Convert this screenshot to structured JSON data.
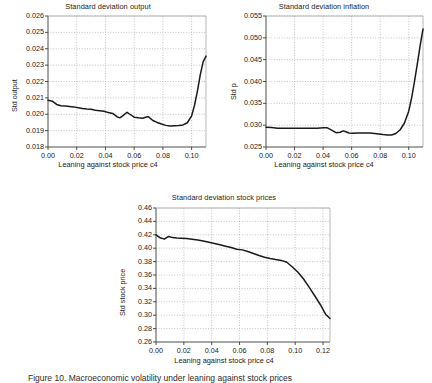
{
  "figure": {
    "caption_visible_fragment": "Figure 10. Macroeconomic volatility under leaning against stock prices"
  },
  "chart_data": [
    {
      "id": "std-output",
      "type": "line",
      "title": "Standard deviation output",
      "xlabel": "Leaning against stock price c4",
      "ylabel": "Std output",
      "xlim": [
        0.0,
        0.11
      ],
      "ylim": [
        0.018,
        0.026
      ],
      "xticks": [
        "0.00",
        "0.02",
        "0.04",
        "0.06",
        "0.08",
        "0.10"
      ],
      "xtick_values": [
        0.0,
        0.02,
        0.04,
        0.06,
        0.08,
        0.1
      ],
      "yticks": [
        "0.018",
        "0.019",
        "0.020",
        "0.021",
        "0.022",
        "0.023",
        "0.024",
        "0.025",
        "0.026"
      ],
      "ytick_values": [
        0.018,
        0.019,
        0.02,
        0.021,
        0.022,
        0.023,
        0.024,
        0.025,
        0.026
      ],
      "grid": true,
      "legend": "none",
      "line_color": "#1a1a1a",
      "x": [
        0.0,
        0.003,
        0.006,
        0.009,
        0.012,
        0.015,
        0.018,
        0.021,
        0.024,
        0.027,
        0.03,
        0.033,
        0.036,
        0.039,
        0.042,
        0.045,
        0.048,
        0.05,
        0.052,
        0.055,
        0.057,
        0.06,
        0.063,
        0.066,
        0.069,
        0.07,
        0.073,
        0.076,
        0.079,
        0.082,
        0.085,
        0.088,
        0.091,
        0.094,
        0.097,
        0.1,
        0.102,
        0.104,
        0.106,
        0.108,
        0.11
      ],
      "y": [
        0.02085,
        0.0208,
        0.0206,
        0.02052,
        0.0205,
        0.02048,
        0.02045,
        0.0204,
        0.02035,
        0.02032,
        0.0203,
        0.02025,
        0.02022,
        0.02018,
        0.0201,
        0.02005,
        0.01985,
        0.01978,
        0.0199,
        0.02012,
        0.02,
        0.01982,
        0.01978,
        0.01976,
        0.01985,
        0.01984,
        0.01962,
        0.0195,
        0.0194,
        0.01932,
        0.01928,
        0.0193,
        0.01932,
        0.01935,
        0.01948,
        0.0199,
        0.02055,
        0.0214,
        0.0224,
        0.0232,
        0.02355
      ]
    },
    {
      "id": "std-inflation",
      "type": "line",
      "title": "Standard deviation inflation",
      "xlabel": "Leaning against stock price c4",
      "ylabel": "Std p",
      "xlim": [
        0.0,
        0.11
      ],
      "ylim": [
        0.025,
        0.055
      ],
      "xticks": [
        "0.00",
        "0.02",
        "0.04",
        "0.06",
        "0.08",
        "0.10"
      ],
      "xtick_values": [
        0.0,
        0.02,
        0.04,
        0.06,
        0.08,
        0.1
      ],
      "yticks": [
        "0.025",
        "0.030",
        "0.035",
        "0.040",
        "0.045",
        "0.050",
        "0.055"
      ],
      "ytick_values": [
        0.025,
        0.03,
        0.035,
        0.04,
        0.045,
        0.05,
        0.055
      ],
      "grid": true,
      "legend": "none",
      "line_color": "#1a1a1a",
      "x": [
        0.0,
        0.004,
        0.008,
        0.012,
        0.016,
        0.02,
        0.024,
        0.028,
        0.032,
        0.036,
        0.04,
        0.043,
        0.046,
        0.049,
        0.052,
        0.054,
        0.056,
        0.058,
        0.061,
        0.064,
        0.067,
        0.07,
        0.073,
        0.076,
        0.079,
        0.082,
        0.085,
        0.088,
        0.091,
        0.094,
        0.097,
        0.1,
        0.102,
        0.104,
        0.106,
        0.108,
        0.11
      ],
      "y": [
        0.02955,
        0.02945,
        0.0293,
        0.02928,
        0.0293,
        0.02928,
        0.0293,
        0.02928,
        0.0293,
        0.02932,
        0.02938,
        0.0294,
        0.02885,
        0.02828,
        0.02838,
        0.0287,
        0.02848,
        0.0282,
        0.02815,
        0.02818,
        0.0282,
        0.02822,
        0.02818,
        0.0281,
        0.028,
        0.02785,
        0.02775,
        0.02775,
        0.0281,
        0.02895,
        0.0305,
        0.0332,
        0.0362,
        0.0399,
        0.044,
        0.0482,
        0.052
      ]
    },
    {
      "id": "std-stock-prices",
      "type": "line",
      "title": "Standard deviation stock prices",
      "xlabel": "Leaning against stock price c4",
      "ylabel": "Std stock price",
      "xlim": [
        0.0,
        0.125
      ],
      "ylim": [
        0.26,
        0.46
      ],
      "xticks": [
        "0.00",
        "0.02",
        "0.04",
        "0.06",
        "0.08",
        "0.10",
        "0.12"
      ],
      "xtick_values": [
        0.0,
        0.02,
        0.04,
        0.06,
        0.08,
        0.1,
        0.12
      ],
      "yticks": [
        "0.26",
        "0.28",
        "0.30",
        "0.32",
        "0.34",
        "0.36",
        "0.38",
        "0.40",
        "0.42",
        "0.44",
        "0.46"
      ],
      "ytick_values": [
        0.26,
        0.28,
        0.3,
        0.32,
        0.34,
        0.36,
        0.38,
        0.4,
        0.42,
        0.44,
        0.46
      ],
      "grid": true,
      "legend": "none",
      "line_color": "#1a1a1a",
      "x": [
        0.0,
        0.003,
        0.006,
        0.009,
        0.012,
        0.015,
        0.018,
        0.022,
        0.026,
        0.03,
        0.034,
        0.038,
        0.042,
        0.046,
        0.05,
        0.054,
        0.058,
        0.062,
        0.066,
        0.07,
        0.074,
        0.078,
        0.082,
        0.086,
        0.09,
        0.094,
        0.098,
        0.102,
        0.106,
        0.11,
        0.114,
        0.118,
        0.122,
        0.125
      ],
      "y": [
        0.42,
        0.4155,
        0.4135,
        0.4175,
        0.4158,
        0.4152,
        0.415,
        0.4143,
        0.4135,
        0.4122,
        0.4108,
        0.409,
        0.407,
        0.405,
        0.403,
        0.401,
        0.3985,
        0.3975,
        0.395,
        0.392,
        0.389,
        0.3865,
        0.3845,
        0.383,
        0.3818,
        0.379,
        0.372,
        0.364,
        0.354,
        0.342,
        0.329,
        0.316,
        0.301,
        0.295
      ]
    }
  ]
}
